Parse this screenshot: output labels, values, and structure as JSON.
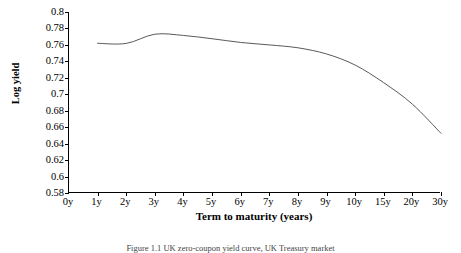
{
  "chart_data": {
    "type": "line",
    "title": "",
    "xlabel": "Term to maturity (years)",
    "ylabel": "Log yield",
    "categories": [
      "0y",
      "1y",
      "2y",
      "3y",
      "4y",
      "5y",
      "6y",
      "7y",
      "8y",
      "9y",
      "10y",
      "15y",
      "20y",
      "30y"
    ],
    "x_tick_labels": [
      "0y",
      "1y",
      "2y",
      "3y",
      "4y",
      "5y",
      "6y",
      "7y",
      "8y",
      "9y",
      "10y",
      "15y",
      "20y",
      "30y"
    ],
    "y_tick_labels": [
      "0.8",
      "0.78",
      "0.76",
      "0.74",
      "0.72",
      "0.7",
      "0.68",
      "0.66",
      "0.64",
      "0.62",
      "0.6",
      "0.58"
    ],
    "y_tick_values": [
      0.8,
      0.78,
      0.76,
      0.74,
      0.72,
      0.7,
      0.68,
      0.66,
      0.64,
      0.62,
      0.6,
      0.58
    ],
    "ylim": [
      0.58,
      0.8
    ],
    "y_tick_step": 0.02,
    "grid": false,
    "legend": false,
    "legend_position": "none",
    "line_color": "#595959",
    "line_width": 1.0,
    "markers": false,
    "series": [
      {
        "name": "Log yield curve",
        "x": [
          "1y",
          "2y",
          "3y",
          "4y",
          "5y",
          "6y",
          "7y",
          "8y",
          "9y",
          "10y",
          "15y",
          "20y",
          "30y"
        ],
        "values": [
          0.762,
          0.7618,
          0.773,
          0.7715,
          0.7675,
          0.763,
          0.76,
          0.7565,
          0.749,
          0.7355,
          0.714,
          0.688,
          0.6525
        ]
      }
    ]
  },
  "caption": {
    "text": "Figure 1.1 UK zero-coupon yield curve, UK Treasury market"
  },
  "colors": {
    "axis": "#000000",
    "line": "#595959",
    "background": "#ffffff",
    "caption": "#444444"
  }
}
